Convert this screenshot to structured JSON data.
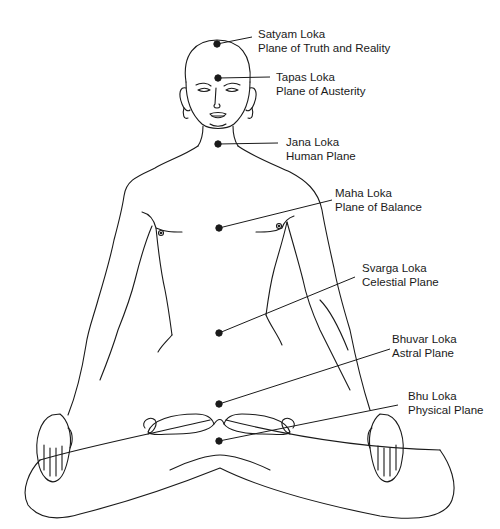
{
  "diagram": {
    "line_color": "#1a1a1a",
    "background": "#ffffff",
    "markers": [
      {
        "id": "satyam",
        "name": "Satyam Loka",
        "description": "Plane of Truth and Reality",
        "dot": [
          217,
          44
        ],
        "line_end": [
          252,
          37
        ],
        "label_pos": [
          258,
          27
        ]
      },
      {
        "id": "tapas",
        "name": "Tapas Loka",
        "description": "Plane of Austerity",
        "dot": [
          218,
          78
        ],
        "line_end": [
          270,
          77
        ],
        "label_pos": [
          276,
          70
        ]
      },
      {
        "id": "jana",
        "name": "Jana Loka",
        "description": "Human Plane",
        "dot": [
          218,
          144
        ],
        "line_end": [
          278,
          143
        ],
        "label_pos": [
          286,
          135
        ]
      },
      {
        "id": "maha",
        "name": "Maha Loka",
        "description": "Plane of Balance",
        "dot": [
          219,
          228
        ],
        "line_end": [
          332,
          200
        ],
        "label_pos": [
          335,
          186
        ]
      },
      {
        "id": "svarga",
        "name": "Svarga Loka",
        "description": "Celestial Plane",
        "dot": [
          219,
          333
        ],
        "line_end": [
          355,
          277
        ],
        "label_pos": [
          362,
          261
        ]
      },
      {
        "id": "bhuvar",
        "name": "Bhuvar Loka",
        "description": "Astral Plane",
        "dot": [
          219,
          404
        ],
        "line_end": [
          390,
          349
        ],
        "label_pos": [
          392,
          332
        ]
      },
      {
        "id": "bhu",
        "name": "Bhu Loka",
        "description": "Physical Plane",
        "dot": [
          219,
          441
        ],
        "line_end": [
          398,
          405
        ],
        "label_pos": [
          408,
          389
        ]
      }
    ]
  }
}
